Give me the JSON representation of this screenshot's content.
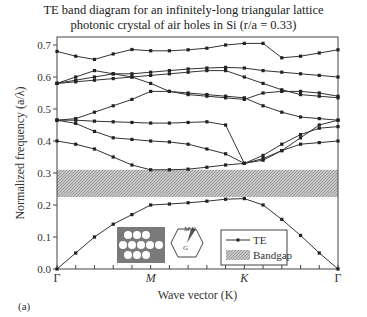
{
  "chart_data": {
    "type": "line",
    "title_line1": "TE band diagram for an infinitely-long triangular lattice",
    "title_line2": "photonic crystal of air holes in Si (r/a = 0.33)",
    "xlabel": "Wave vector (K)",
    "ylabel": "Normalized frequency (a/λ)",
    "panel_label": "(a)",
    "ylim": [
      0,
      0.72
    ],
    "yticks": [
      "0.0",
      "0.1",
      "0.2",
      "0.3",
      "0.4",
      "0.5",
      "0.6",
      "0.7"
    ],
    "xtick_labels": [
      {
        "label": "Γ",
        "index": 0
      },
      {
        "label": "M",
        "index": 5
      },
      {
        "label": "K",
        "index": 10
      },
      {
        "label": "Γ",
        "index": 15
      }
    ],
    "k_points": 16,
    "bandgap": {
      "low": 0.225,
      "high": 0.31,
      "label": "Bandgap"
    },
    "legend": {
      "series_label": "TE",
      "gap_label": "Bandgap"
    },
    "inset_bz_labels": {
      "M": "M",
      "K": "K",
      "G": "G"
    },
    "series": [
      {
        "name": "band1",
        "values": [
          0,
          0.05,
          0.1,
          0.14,
          0.17,
          0.2,
          0.203,
          0.207,
          0.212,
          0.218,
          0.22,
          0.2,
          0.155,
          0.105,
          0.05,
          0
        ]
      },
      {
        "name": "band2",
        "values": [
          0.4,
          0.39,
          0.375,
          0.35,
          0.325,
          0.31,
          0.31,
          0.312,
          0.318,
          0.325,
          0.33,
          0.345,
          0.37,
          0.39,
          0.395,
          0.4
        ]
      },
      {
        "name": "band3",
        "values": [
          0.465,
          0.455,
          0.43,
          0.41,
          0.405,
          0.4,
          0.397,
          0.39,
          0.375,
          0.36,
          0.33,
          0.34,
          0.37,
          0.41,
          0.45,
          0.465
        ]
      },
      {
        "name": "band4",
        "values": [
          0.465,
          0.465,
          0.462,
          0.46,
          0.458,
          0.456,
          0.456,
          0.458,
          0.46,
          0.45,
          0.33,
          0.355,
          0.39,
          0.42,
          0.44,
          0.445
        ]
      },
      {
        "name": "band5",
        "values": [
          0.465,
          0.47,
          0.49,
          0.51,
          0.53,
          0.555,
          0.555,
          0.55,
          0.545,
          0.54,
          0.535,
          0.51,
          0.49,
          0.475,
          0.47,
          0.465
        ]
      },
      {
        "name": "band6",
        "values": [
          0.58,
          0.585,
          0.59,
          0.595,
          0.6,
          0.605,
          0.61,
          0.615,
          0.62,
          0.62,
          0.6,
          0.58,
          0.56,
          0.545,
          0.54,
          0.535
        ]
      },
      {
        "name": "band7",
        "values": [
          0.58,
          0.59,
          0.6,
          0.61,
          0.6,
          0.58,
          0.555,
          0.545,
          0.54,
          0.535,
          0.53,
          0.55,
          0.555,
          0.555,
          0.55,
          0.54
        ]
      },
      {
        "name": "band8",
        "values": [
          0.58,
          0.6,
          0.62,
          0.61,
          0.61,
          0.615,
          0.62,
          0.625,
          0.628,
          0.63,
          0.628,
          0.62,
          0.615,
          0.61,
          0.605,
          0.6
        ]
      },
      {
        "name": "band9",
        "values": [
          0.68,
          0.665,
          0.655,
          0.672,
          0.686,
          0.682,
          0.682,
          0.685,
          0.69,
          0.7,
          0.705,
          0.705,
          0.66,
          0.665,
          0.675,
          0.685
        ]
      }
    ]
  }
}
